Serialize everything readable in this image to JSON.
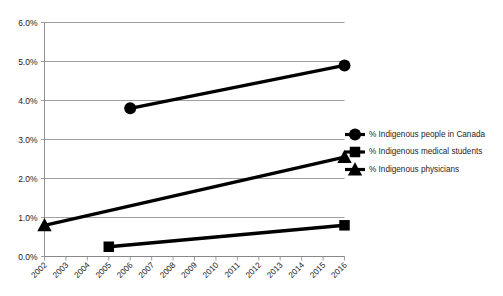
{
  "chart_data": {
    "type": "line",
    "title": "",
    "xlabel": "",
    "ylabel": "",
    "ylim": [
      0.0,
      6.0
    ],
    "ytick_labels": [
      "0.0%",
      "1.0%",
      "2.0%",
      "3.0%",
      "4.0%",
      "5.0%",
      "6.0%"
    ],
    "ytick_values": [
      0.0,
      1.0,
      2.0,
      3.0,
      4.0,
      5.0,
      6.0
    ],
    "grid": true,
    "legend_position": "right",
    "categories": [
      "2002",
      "2003",
      "2004",
      "2005",
      "2006",
      "2007",
      "2008",
      "2009",
      "2010",
      "2011",
      "2012",
      "2013",
      "2014",
      "2015",
      "2016"
    ],
    "series": [
      {
        "name": "% Indigenous people in Canada",
        "marker": "circle",
        "x": [
          "2006",
          "2016"
        ],
        "values": [
          3.8,
          4.9
        ]
      },
      {
        "name": "% Indigenous medical students",
        "marker": "square",
        "x": [
          "2005",
          "2016"
        ],
        "values": [
          0.25,
          0.8
        ]
      },
      {
        "name": "% Indigenous physicians",
        "marker": "triangle",
        "x": [
          "2002",
          "2016"
        ],
        "values": [
          0.8,
          2.55
        ]
      }
    ],
    "colors": {
      "series": "#000000",
      "gridline": "#868686",
      "axis": "#868686",
      "background": "#ffffff",
      "text": "#1a1a1a"
    }
  },
  "legend": {
    "items": [
      {
        "label": "% Indigenous people in Canada",
        "marker": "circle"
      },
      {
        "label": "% Indigenous medical students",
        "marker": "square"
      },
      {
        "label": "% Indigenous physicians",
        "marker": "triangle"
      }
    ]
  }
}
